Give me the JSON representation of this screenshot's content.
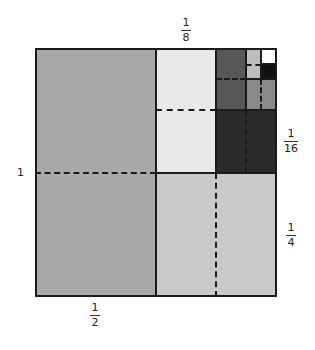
{
  "diagram": {
    "labels": {
      "whole": "1",
      "half": {
        "num": "1",
        "den": "2"
      },
      "quarter": {
        "num": "1",
        "den": "4"
      },
      "eighth": {
        "num": "1",
        "den": "8"
      },
      "sixteenth": {
        "num": "1",
        "den": "16"
      }
    },
    "colors": {
      "half": "#a9a9a9",
      "quarter": "#cacaca",
      "eighth": "#e9e9e9",
      "sixteenth": "#2b2b2b",
      "thirtysecond": "#575757",
      "sixtyfourth": "#8a8a8a",
      "onetwentyeighth": "#bdbdbd",
      "twofiftysixth": "#111111",
      "remainder": "#ffffff",
      "lines": "#1a1a1a"
    }
  }
}
